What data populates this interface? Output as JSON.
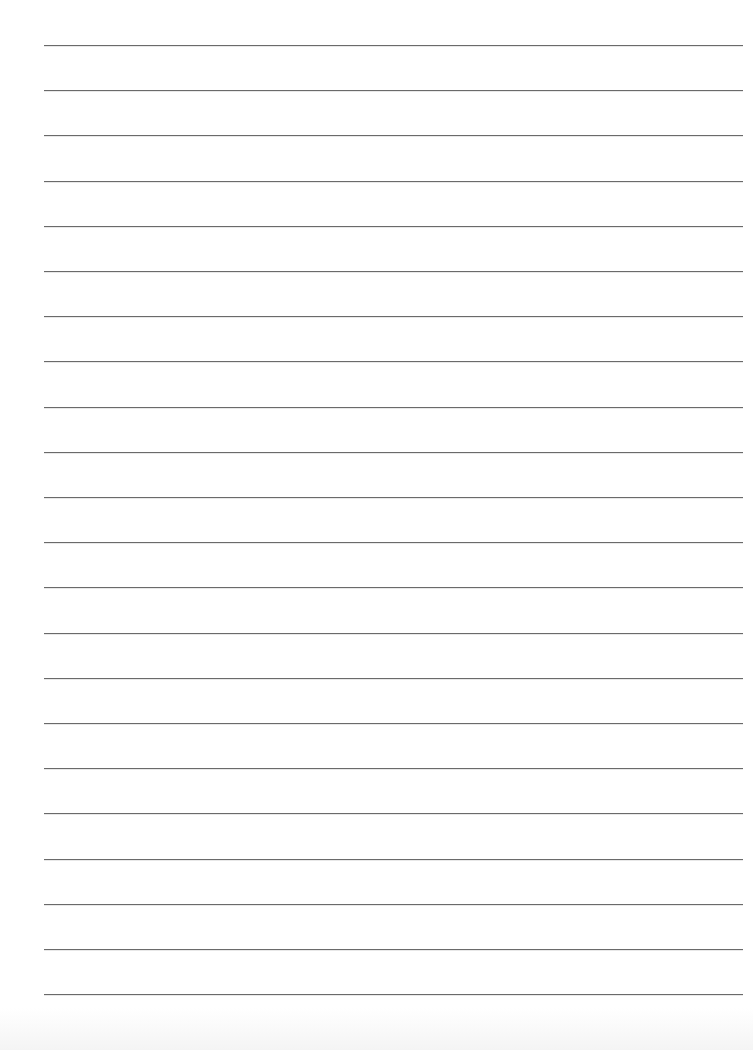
{
  "document": {
    "type": "lined-paper",
    "background_color": "#ffffff",
    "line_color": "#6a6a6a",
    "line_count": 22,
    "first_line_y": 45,
    "line_spacing": 45.2,
    "line_left": 44,
    "line_right": 743,
    "text": ""
  }
}
